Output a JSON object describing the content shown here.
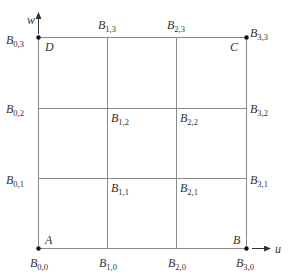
{
  "colors": {
    "grid_line": "#8a8a8a",
    "point": "#111111",
    "text": "#333333"
  },
  "axes": {
    "u_label": "u",
    "w_label": "w"
  },
  "corners": {
    "A": "A",
    "B": "B",
    "C": "C",
    "D": "D"
  },
  "control_points": [
    {
      "id": "B00",
      "base": "B",
      "sub": "0,0"
    },
    {
      "id": "B10",
      "base": "B",
      "sub": "1,0"
    },
    {
      "id": "B20",
      "base": "B",
      "sub": "2,0"
    },
    {
      "id": "B30",
      "base": "B",
      "sub": "3,0"
    },
    {
      "id": "B01",
      "base": "B",
      "sub": "0,1"
    },
    {
      "id": "B11",
      "base": "B",
      "sub": "1,1"
    },
    {
      "id": "B21",
      "base": "B",
      "sub": "2,1"
    },
    {
      "id": "B31",
      "base": "B",
      "sub": "3,1"
    },
    {
      "id": "B02",
      "base": "B",
      "sub": "0,2"
    },
    {
      "id": "B12",
      "base": "B",
      "sub": "1,2"
    },
    {
      "id": "B22",
      "base": "B",
      "sub": "2,2"
    },
    {
      "id": "B32",
      "base": "B",
      "sub": "3,2"
    },
    {
      "id": "B03",
      "base": "B",
      "sub": "0,3"
    },
    {
      "id": "B13",
      "base": "B",
      "sub": "1,3"
    },
    {
      "id": "B23",
      "base": "B",
      "sub": "2,3"
    },
    {
      "id": "B33",
      "base": "B",
      "sub": "3,3"
    }
  ],
  "grid": {
    "columns": 3,
    "rows": 3
  }
}
